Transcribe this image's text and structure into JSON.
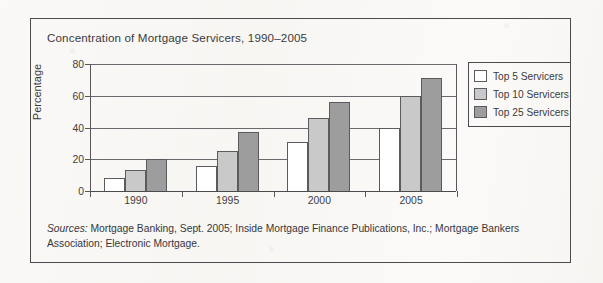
{
  "figure": {
    "title": "Concentration of Mortgage Servicers, 1990–2005",
    "source_label": "Sources:",
    "source_text": " Mortgage Banking, Sept. 2005; Inside Mortgage Finance Publications, Inc.; Mortgage Bankers Association; Electronic Mortgage."
  },
  "legend": {
    "items": [
      {
        "label": "Top 5 Servicers",
        "color": "#ffffff",
        "swatch_name": "legend-swatch-top5"
      },
      {
        "label": "Top 10 Servicers",
        "color": "#c9c9c9",
        "swatch_name": "legend-swatch-top10"
      },
      {
        "label": "Top 25 Servicers",
        "color": "#9d9d9d",
        "swatch_name": "legend-swatch-top25"
      }
    ]
  },
  "chart_data": {
    "type": "bar",
    "title": "Concentration of Mortgage Servicers, 1990–2005",
    "xlabel": "",
    "ylabel": "Percentage",
    "categories": [
      "1990",
      "1995",
      "2000",
      "2005"
    ],
    "series": [
      {
        "name": "Top 5 Servicers",
        "color": "#ffffff",
        "values": [
          8,
          16,
          31,
          40
        ]
      },
      {
        "name": "Top 10 Servicers",
        "color": "#c9c9c9",
        "values": [
          13,
          25,
          46,
          60
        ]
      },
      {
        "name": "Top 25 Servicers",
        "color": "#9d9d9d",
        "values": [
          20,
          37,
          56,
          71
        ]
      }
    ],
    "ylim": [
      0,
      80
    ],
    "yticks": [
      0,
      20,
      40,
      60,
      80
    ],
    "ytick_labels": [
      "0",
      "20",
      "40",
      "60",
      "80"
    ],
    "grid": true,
    "legend_position": "right"
  }
}
